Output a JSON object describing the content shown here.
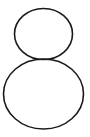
{
  "figure": {
    "glyph": "8",
    "stroke_color": "#1a1a1a",
    "background": "#ffffff",
    "top_loop": {
      "cx": 43.5,
      "cy": 34,
      "rx": 29,
      "ry": 25.5
    },
    "bottom_loop": {
      "cx": 43.5,
      "cy": 94,
      "rx": 40,
      "ry": 35
    }
  }
}
